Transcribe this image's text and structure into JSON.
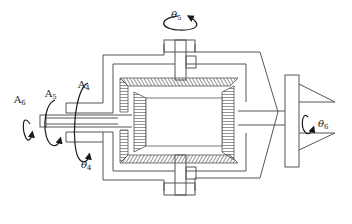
{
  "diagram": {
    "stroke_color": "#555555",
    "arrow_color": "#1a1a1a",
    "background": "#ffffff",
    "labels": {
      "A6": {
        "base": "A",
        "sub": "6"
      },
      "A5": {
        "base": "A",
        "sub": "5"
      },
      "A4": {
        "base": "A",
        "sub": "4"
      },
      "theta4": {
        "base": "θ",
        "sub": "4"
      },
      "theta5": {
        "base": "θ",
        "sub": "5"
      },
      "theta6": {
        "base": "θ",
        "sub": "6"
      }
    },
    "components": [
      "input-shaft-A6",
      "input-shaft-A5",
      "input-shaft-A4",
      "bevel-gear-housing",
      "top-bevel-gear-shaft",
      "bottom-bevel-gear-shaft",
      "output-shaft",
      "end-effector-flange"
    ]
  }
}
